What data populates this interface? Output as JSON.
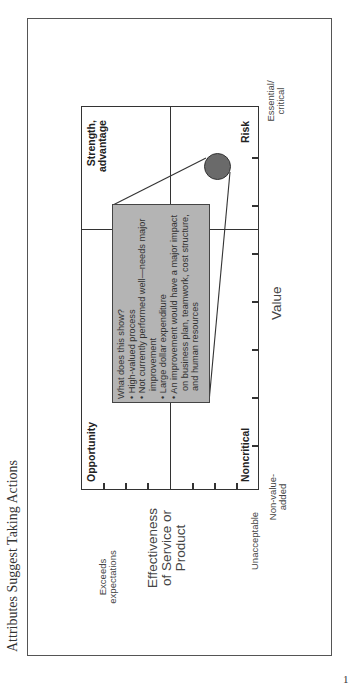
{
  "page": {
    "title": "Attributes Suggest Taking Actions",
    "page_number": "1",
    "orientation": "rotated -90deg (landscape figure on portrait page)"
  },
  "diagram": {
    "type": "quadrant-matrix",
    "x_axis": {
      "label": "Value",
      "low_label": "Non-value-added",
      "low_label_lines": [
        "Non-value-",
        "added"
      ],
      "high_label": "Essential/critical",
      "high_label_lines": [
        "Essential/",
        "critical"
      ],
      "ticks": 7
    },
    "y_axis": {
      "label": "Effectiveness of Service or Product",
      "label_lines": [
        "Effectiveness",
        "of Service or",
        "Product"
      ],
      "low_label": "Unacceptable",
      "high_label": "Exceeds expectations",
      "high_label_lines": [
        "Exceeds",
        "expectations"
      ],
      "ticks": 7
    },
    "quadrants": {
      "top_left": "Opportunity",
      "top_right": "Strength, advantage",
      "top_right_lines": [
        "Strength,",
        "advantage"
      ],
      "bottom_left": "Noncritical",
      "bottom_right": "Risk"
    },
    "marker": {
      "quadrant": "bottom_right",
      "color": "#6a6a6a",
      "position": "high value, low effectiveness"
    },
    "callout": {
      "heading": "What does this show?",
      "bullets": [
        "High-valued process",
        "Not currently performed well—needs major improvement",
        "Large dollar expenditure",
        "An improvement would have a major impact on business plan, teamwork, cost structure, and human resources"
      ],
      "lines": [
        {
          "bullet": false,
          "text": "What does this show?"
        },
        {
          "bullet": true,
          "text": "High-valued process"
        },
        {
          "bullet": true,
          "text": "Not currently performed well—needs major"
        },
        {
          "bullet": false,
          "text": "improvement"
        },
        {
          "bullet": true,
          "text": "Large dollar expenditure"
        },
        {
          "bullet": true,
          "text": "An improvement would have a major impact"
        },
        {
          "bullet": false,
          "text": "on business plan, teamwork, cost structure,"
        },
        {
          "bullet": false,
          "text": "and human resources"
        }
      ],
      "bullet_glyph": "•",
      "fill_color": "#b4b4b4"
    }
  }
}
